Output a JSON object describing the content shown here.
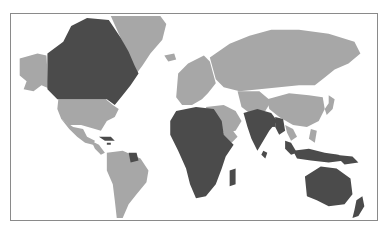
{
  "map": {
    "type": "choropleth",
    "title": "",
    "legend": [],
    "colors": {
      "highlighted": "#4b4b4b",
      "other": "#a7a7a7",
      "ocean": "#ffffff",
      "frame": "#8a8a8a"
    },
    "highlighted_regions": [
      "Canada",
      "Cuba",
      "Jamaica",
      "Guyana",
      "Africa",
      "India",
      "Sri Lanka",
      "Bangladesh",
      "Myanmar",
      "Malaysia",
      "Indonesia",
      "Papua New Guinea",
      "Australia",
      "New Zealand",
      "Madagascar"
    ],
    "other_regions": [
      "Alaska",
      "United States",
      "Mexico",
      "Central America",
      "Greenland",
      "Iceland",
      "South America",
      "Europe",
      "Russia",
      "Middle East",
      "Ethiopia",
      "Yemen",
      "Central Asia",
      "China",
      "Mongolia",
      "Japan",
      "Korea",
      "Thailand",
      "Vietnam",
      "Philippines"
    ]
  }
}
